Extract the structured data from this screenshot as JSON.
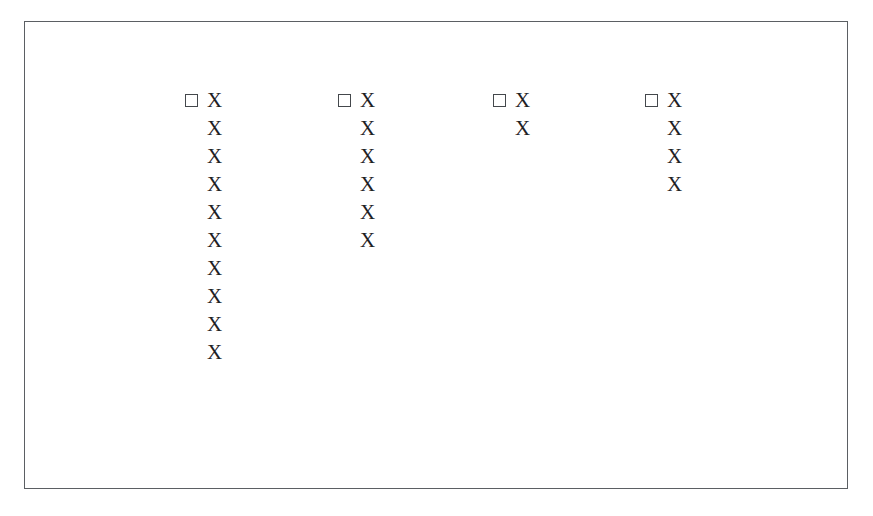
{
  "figure": {
    "unit_glyph": "X",
    "checkbox_glyph": "☐",
    "frame_color": "#5b5f63",
    "mark_color": "#1f2225",
    "background_color": "#ffffff"
  },
  "chart_data": {
    "type": "bar",
    "title": "",
    "subtitle": "",
    "xlabel": "",
    "ylabel": "",
    "grid": false,
    "legend": "none",
    "orientation": "vertical-pictogram",
    "unit_symbol": "X",
    "unit_value": 1,
    "ylim": [
      0,
      10
    ],
    "categories": [
      "1",
      "2",
      "3",
      "4"
    ],
    "values": [
      10,
      6,
      2,
      4
    ],
    "series": [
      {
        "name": "Series 1",
        "values": [
          10,
          6,
          2,
          4
        ]
      }
    ],
    "columns": [
      {
        "index": 0,
        "count": 10,
        "marks": [
          "X",
          "X",
          "X",
          "X",
          "X",
          "X",
          "X",
          "X",
          "X",
          "X"
        ]
      },
      {
        "index": 1,
        "count": 6,
        "marks": [
          "X",
          "X",
          "X",
          "X",
          "X",
          "X"
        ]
      },
      {
        "index": 2,
        "count": 2,
        "marks": [
          "X",
          "X"
        ]
      },
      {
        "index": 3,
        "count": 4,
        "marks": [
          "X",
          "X",
          "X",
          "X"
        ]
      }
    ]
  }
}
